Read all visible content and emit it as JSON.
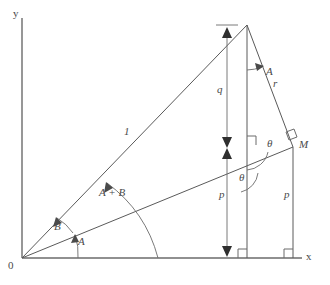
{
  "figure": {
    "type": "geometry-diagram",
    "background_color": "#ffffff",
    "line_color": "#5a5a5a",
    "label_color": "#4a4a4a"
  },
  "axes": {
    "x_label": "x",
    "y_label": "y",
    "origin_label": "0",
    "x_axis": {
      "x1": 22,
      "y1": 258,
      "x2": 302,
      "y2": 258
    },
    "y_axis": {
      "x1": 22,
      "y1": 258,
      "x2": 22,
      "y2": 18
    }
  },
  "points": {
    "origin": {
      "name": "0",
      "x": 22,
      "y": 258
    },
    "apex": {
      "name": "apex",
      "x": 247,
      "y": 25
    },
    "m": {
      "name": "M",
      "x": 293,
      "y": 147
    },
    "foot_apex": {
      "name": "foot-apex",
      "x": 247,
      "y": 258
    },
    "foot_m": {
      "name": "foot-m",
      "x": 293,
      "y": 258
    }
  },
  "segments": [
    {
      "name": "hypotenuse-unit",
      "x1": 22,
      "y1": 258,
      "x2": 247,
      "y2": 25
    },
    {
      "name": "ray-to-m",
      "x1": 22,
      "y1": 258,
      "x2": 293,
      "y2": 147
    },
    {
      "name": "side-r",
      "x1": 247,
      "y1": 25,
      "x2": 293,
      "y2": 147
    },
    {
      "name": "vertical-apex",
      "x1": 247,
      "y1": 25,
      "x2": 247,
      "y2": 258
    },
    {
      "name": "vertical-m",
      "x1": 293,
      "y1": 147,
      "x2": 293,
      "y2": 258
    }
  ],
  "labels": {
    "unit_side": "1",
    "side_r": "r",
    "segment_q": "q",
    "segment_p_left": "p",
    "segment_p_right": "p",
    "point_m": "M",
    "angle_a_origin": "A",
    "angle_b_origin": "B",
    "angle_a_plus_b": "A + B",
    "angle_a_apex": "A",
    "angle_theta_upper": "θ",
    "angle_theta_lower": "θ"
  },
  "dimension_lines": [
    {
      "name": "q-dimension",
      "label": "q",
      "x": 227,
      "y_top": 25,
      "y_bottom": 148
    },
    {
      "name": "p-dimension",
      "label": "p",
      "x": 227,
      "y_top": 148,
      "y_bottom": 258
    }
  ],
  "right_angle_markers": [
    {
      "name": "right-angle-foot-apex",
      "x": 247,
      "y": 258
    },
    {
      "name": "right-angle-foot-m",
      "x": 293,
      "y": 258
    },
    {
      "name": "right-angle-at-apex-vertical",
      "x": 247,
      "y": 147
    },
    {
      "name": "right-angle-at-m",
      "x": 293,
      "y": 147
    }
  ]
}
